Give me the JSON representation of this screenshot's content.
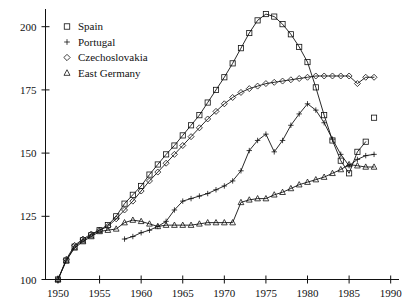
{
  "chart_data": {
    "type": "line",
    "title": "",
    "subtitle": "",
    "xlabel": "",
    "ylabel": "",
    "xlim": [
      1948.5,
      1991
    ],
    "ylim": [
      100,
      207
    ],
    "grid": false,
    "legend_position": "top-left",
    "x_ticks": [
      1950,
      1955,
      1960,
      1965,
      1970,
      1975,
      1980,
      1985,
      1990
    ],
    "x_tick_labels": [
      "1950",
      "1955",
      "1960",
      "1965",
      "1970",
      "1975",
      "1980",
      "1985",
      "1990"
    ],
    "y_ticks": [
      100,
      125,
      150,
      175,
      200
    ],
    "y_tick_labels": [
      "100",
      "125",
      "150",
      "175",
      "200"
    ],
    "series": [
      {
        "name": "Spain",
        "marker": "square",
        "legend_glyph": "square",
        "points": [
          [
            1950,
            100.0
          ],
          [
            1951,
            107.5
          ],
          [
            1952,
            113.0
          ],
          [
            1953,
            115.5
          ],
          [
            1954,
            117.5
          ],
          [
            1955,
            119.5
          ],
          [
            1956,
            121.5
          ],
          [
            1957,
            125.0
          ],
          [
            1958,
            130.0
          ],
          [
            1959,
            133.5
          ],
          [
            1960,
            137.0
          ],
          [
            1961,
            141.5
          ],
          [
            1962,
            145.5
          ],
          [
            1963,
            149.5
          ],
          [
            1964,
            153.0
          ],
          [
            1965,
            157.0
          ],
          [
            1966,
            161.0
          ],
          [
            1967,
            165.0
          ],
          [
            1968,
            170.0
          ],
          [
            1969,
            175.0
          ],
          [
            1970,
            180.0
          ],
          [
            1971,
            185.5
          ],
          [
            1972,
            191.5
          ],
          [
            1973,
            197.5
          ],
          [
            1974,
            202.5
          ],
          [
            1975,
            205.0
          ],
          [
            1976,
            204.0
          ],
          [
            1977,
            201.0
          ],
          [
            1978,
            197.0
          ],
          [
            1979,
            192.0
          ],
          [
            1980,
            186.0
          ],
          [
            1981,
            176.0
          ],
          [
            1982,
            165.0
          ],
          [
            1983,
            155.0
          ],
          [
            1984,
            147.0
          ],
          [
            1985,
            142.0
          ],
          [
            1986,
            150.5
          ],
          [
            1987,
            154.5
          ]
        ]
      },
      {
        "name": "Portugal",
        "marker": "plus",
        "legend_glyph": "plus",
        "points": [
          [
            1958,
            116.0
          ],
          [
            1959,
            117.0
          ],
          [
            1960,
            118.5
          ],
          [
            1961,
            119.5
          ],
          [
            1962,
            121.0
          ],
          [
            1963,
            123.0
          ],
          [
            1964,
            127.5
          ],
          [
            1965,
            131.0
          ],
          [
            1966,
            132.0
          ],
          [
            1967,
            133.0
          ],
          [
            1968,
            134.0
          ],
          [
            1969,
            135.5
          ],
          [
            1970,
            137.0
          ],
          [
            1971,
            139.0
          ],
          [
            1972,
            143.0
          ],
          [
            1973,
            151.0
          ],
          [
            1974,
            155.0
          ],
          [
            1975,
            157.5
          ],
          [
            1976,
            150.5
          ],
          [
            1977,
            155.0
          ],
          [
            1978,
            161.0
          ],
          [
            1979,
            165.5
          ],
          [
            1980,
            169.5
          ],
          [
            1981,
            167.0
          ],
          [
            1982,
            162.0
          ],
          [
            1983,
            155.5
          ],
          [
            1984,
            149.5
          ],
          [
            1985,
            145.0
          ],
          [
            1986,
            147.5
          ],
          [
            1987,
            149.0
          ],
          [
            1988,
            149.5
          ]
        ]
      },
      {
        "name": "Czechoslovakia",
        "marker": "diamond",
        "legend_glyph": "diamond",
        "points": [
          [
            1950,
            100.0
          ],
          [
            1951,
            108.0
          ],
          [
            1952,
            113.5
          ],
          [
            1953,
            116.0
          ],
          [
            1954,
            118.0
          ],
          [
            1955,
            119.5
          ],
          [
            1956,
            121.0
          ],
          [
            1957,
            124.0
          ],
          [
            1958,
            127.5
          ],
          [
            1959,
            131.0
          ],
          [
            1960,
            135.0
          ],
          [
            1961,
            139.0
          ],
          [
            1962,
            142.5
          ],
          [
            1963,
            146.0
          ],
          [
            1964,
            149.5
          ],
          [
            1965,
            153.0
          ],
          [
            1966,
            156.5
          ],
          [
            1967,
            160.0
          ],
          [
            1968,
            163.5
          ],
          [
            1969,
            166.5
          ],
          [
            1970,
            169.5
          ],
          [
            1971,
            172.0
          ],
          [
            1972,
            174.0
          ],
          [
            1973,
            175.5
          ],
          [
            1974,
            176.5
          ],
          [
            1975,
            177.5
          ],
          [
            1976,
            178.0
          ],
          [
            1977,
            178.5
          ],
          [
            1978,
            179.0
          ],
          [
            1979,
            179.5
          ],
          [
            1980,
            180.0
          ],
          [
            1981,
            180.5
          ],
          [
            1982,
            180.5
          ],
          [
            1983,
            180.5
          ],
          [
            1984,
            180.5
          ],
          [
            1985,
            180.5
          ],
          [
            1986,
            177.5
          ],
          [
            1987,
            180.0
          ],
          [
            1988,
            180.0
          ]
        ]
      },
      {
        "name": "East Germany",
        "marker": "triangle",
        "legend_glyph": "triangle",
        "points": [
          [
            1950,
            100.0
          ],
          [
            1951,
            107.5
          ],
          [
            1952,
            112.5
          ],
          [
            1953,
            115.0
          ],
          [
            1954,
            117.0
          ],
          [
            1955,
            119.0
          ],
          [
            1956,
            119.5
          ],
          [
            1957,
            120.0
          ],
          [
            1958,
            122.5
          ],
          [
            1959,
            123.5
          ],
          [
            1960,
            123.0
          ],
          [
            1961,
            122.0
          ],
          [
            1962,
            121.0
          ],
          [
            1963,
            121.5
          ],
          [
            1964,
            121.5
          ],
          [
            1965,
            121.5
          ],
          [
            1966,
            121.5
          ],
          [
            1967,
            122.0
          ],
          [
            1968,
            122.5
          ],
          [
            1969,
            122.5
          ],
          [
            1970,
            122.5
          ],
          [
            1971,
            122.5
          ],
          [
            1972,
            130.5
          ],
          [
            1973,
            131.5
          ],
          [
            1974,
            132.0
          ],
          [
            1975,
            132.0
          ],
          [
            1976,
            133.5
          ],
          [
            1977,
            134.5
          ],
          [
            1978,
            136.0
          ],
          [
            1979,
            137.5
          ],
          [
            1980,
            138.5
          ],
          [
            1981,
            139.5
          ],
          [
            1982,
            140.5
          ],
          [
            1983,
            142.0
          ],
          [
            1984,
            143.5
          ],
          [
            1985,
            145.5
          ],
          [
            1986,
            145.0
          ],
          [
            1987,
            144.5
          ],
          [
            1988,
            144.5
          ]
        ]
      }
    ],
    "isolated_points": [
      {
        "series": "Spain",
        "marker": "square",
        "x": 1988,
        "y": 164.0
      }
    ]
  },
  "legend": {
    "items": [
      {
        "label": "Spain",
        "glyph": "square"
      },
      {
        "label": "Portugal",
        "glyph": "plus"
      },
      {
        "label": "Czechoslovakia",
        "glyph": "diamond"
      },
      {
        "label": "East Germany",
        "glyph": "triangle"
      }
    ]
  },
  "colors": {
    "ink": "#111111",
    "background": "#ffffff"
  }
}
